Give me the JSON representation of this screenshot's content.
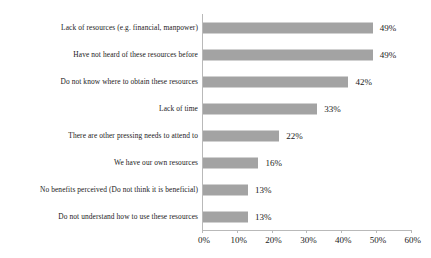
{
  "chart_data": {
    "type": "bar",
    "orientation": "horizontal",
    "title": "",
    "xlabel": "",
    "ylabel": "",
    "xlim": [
      0,
      60
    ],
    "grid": false,
    "legend": false,
    "value_suffix": "%",
    "categories": [
      "Lack of resources (e.g. financial, manpower)",
      "Have not heard of these resources before",
      "Do not know where to obtain these resources",
      "Lack of time",
      "There are other pressing needs to attend to",
      "We have our own resources",
      "No benefits perceived (Do not think it is beneficial)",
      "Do not understand how to use these resources"
    ],
    "values": [
      49,
      49,
      42,
      33,
      22,
      16,
      13,
      13
    ],
    "value_labels": [
      "49%",
      "49%",
      "42%",
      "33%",
      "22%",
      "16%",
      "13%",
      "13%"
    ],
    "xticks": [
      0,
      10,
      20,
      30,
      40,
      50,
      60
    ],
    "xtick_labels": [
      "0%",
      "10%",
      "20%",
      "30%",
      "40%",
      "50%",
      "60%"
    ],
    "bar_color": "#a3a3a3",
    "axis_color": "#b9b9b9",
    "text_color": "#1a1a1a",
    "background_color": "#ffffff"
  }
}
